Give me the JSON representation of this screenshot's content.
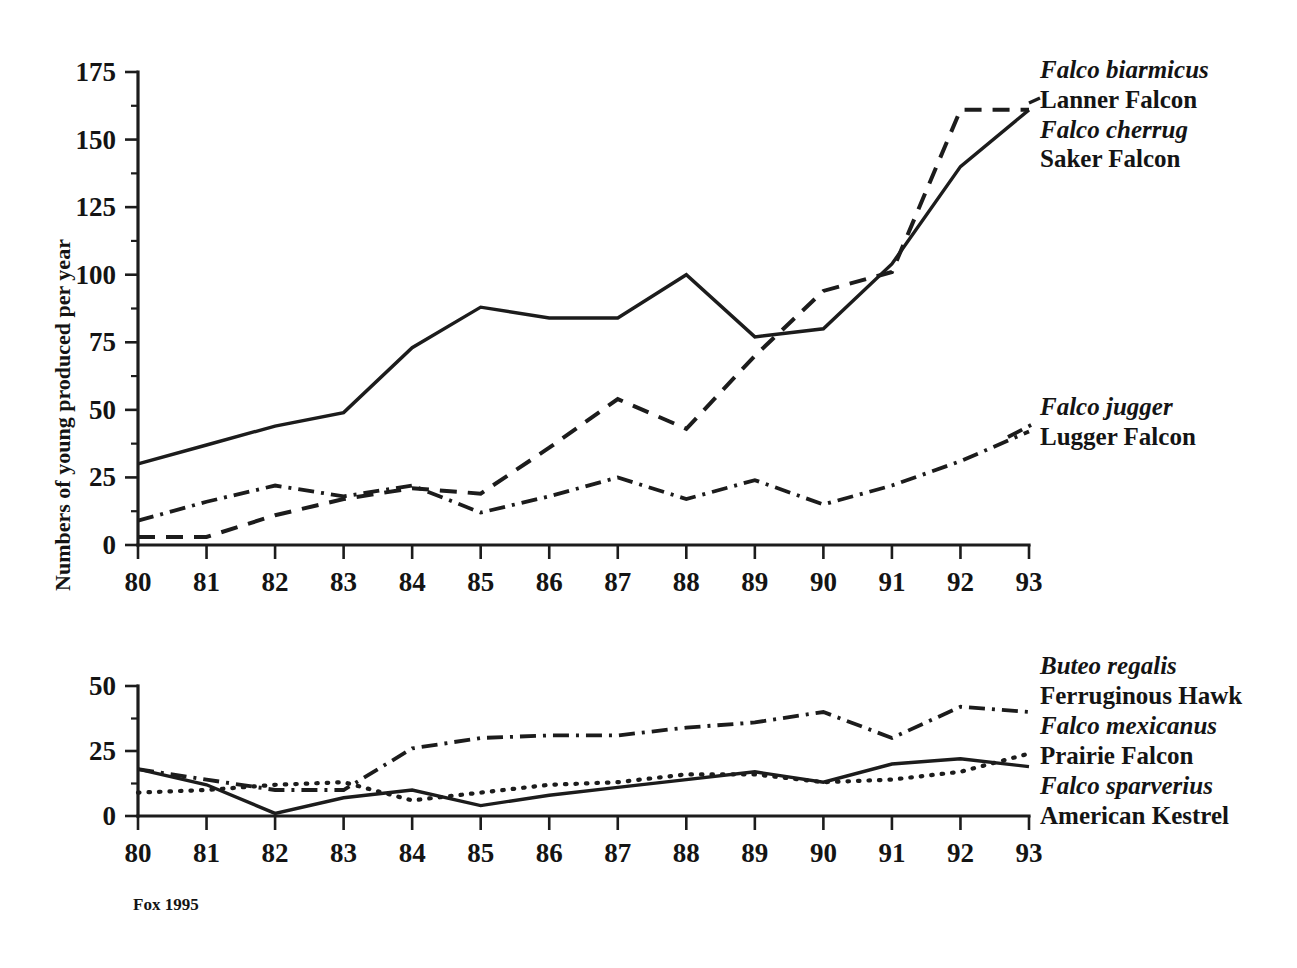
{
  "figure": {
    "source_note": "Fox 1995"
  },
  "chart_data": [
    {
      "id": "top",
      "type": "line",
      "title": "",
      "xlabel": "",
      "ylabel": "Numbers of young produced per year",
      "x": [
        80,
        81,
        82,
        83,
        84,
        85,
        86,
        87,
        88,
        89,
        90,
        91,
        92,
        93
      ],
      "xticklabels": [
        "80",
        "81",
        "82",
        "83",
        "84",
        "85",
        "86",
        "87",
        "88",
        "89",
        "90",
        "91",
        "92",
        "93"
      ],
      "yticks": [
        0,
        25,
        50,
        75,
        100,
        125,
        150,
        175
      ],
      "yticklabels": [
        "0",
        "25",
        "50",
        "75",
        "100",
        "125",
        "150",
        "175"
      ],
      "ylim": [
        0,
        175
      ],
      "grid": false,
      "legend_position": "right",
      "series": [
        {
          "name": "Saker Falcon",
          "scientific_name": "Falco cherrug",
          "style": "solid",
          "values": [
            30,
            37,
            44,
            49,
            73,
            88,
            84,
            84,
            100,
            77,
            80,
            104,
            140,
            161
          ]
        },
        {
          "name": "Lanner Falcon",
          "scientific_name": "Falco biarmicus",
          "style": "dashed",
          "values": [
            3,
            3,
            11,
            17,
            21,
            19,
            36,
            54,
            43,
            70,
            94,
            101,
            161,
            161
          ]
        },
        {
          "name": "Lugger Falcon",
          "scientific_name": "Falco jugger",
          "style": "dashdot",
          "values": [
            9,
            16,
            22,
            18,
            22,
            12,
            18,
            25,
            17,
            24,
            15,
            22,
            31,
            42
          ]
        }
      ]
    },
    {
      "id": "bottom",
      "type": "line",
      "title": "",
      "xlabel": "",
      "ylabel": "",
      "x": [
        80,
        81,
        82,
        83,
        84,
        85,
        86,
        87,
        88,
        89,
        90,
        91,
        92,
        93
      ],
      "xticklabels": [
        "80",
        "81",
        "82",
        "83",
        "84",
        "85",
        "86",
        "87",
        "88",
        "89",
        "90",
        "91",
        "92",
        "93"
      ],
      "yticks": [
        0,
        25,
        50
      ],
      "yticklabels": [
        "0",
        "25",
        "50"
      ],
      "ylim": [
        0,
        50
      ],
      "grid": false,
      "legend_position": "right",
      "series": [
        {
          "name": "Ferruginous Hawk",
          "scientific_name": "Buteo regalis",
          "style": "dashdot",
          "values": [
            18,
            14,
            10,
            10,
            26,
            30,
            31,
            31,
            34,
            36,
            40,
            30,
            42,
            40
          ]
        },
        {
          "name": "Prairie Falcon",
          "scientific_name": "Falco mexicanus",
          "style": "dotted",
          "values": [
            9,
            10,
            12,
            13,
            6,
            9,
            12,
            13,
            16,
            16,
            13,
            14,
            17,
            24
          ]
        },
        {
          "name": "American Kestrel",
          "scientific_name": "Falco sparverius",
          "style": "solid",
          "values": [
            18,
            12,
            1,
            7,
            10,
            4,
            8,
            11,
            14,
            17,
            13,
            20,
            22,
            19
          ]
        }
      ]
    }
  ],
  "legends": {
    "top": [
      {
        "scientific_name": "Falco biarmicus",
        "common_name": "Lanner Falcon"
      },
      {
        "scientific_name": "Falco cherrug",
        "common_name": "Saker Falcon"
      }
    ],
    "top_lugger": [
      {
        "scientific_name": "Falco jugger",
        "common_name": "Lugger Falcon"
      }
    ],
    "bottom": [
      {
        "scientific_name": "Buteo regalis",
        "common_name": "Ferruginous Hawk"
      },
      {
        "scientific_name": "Falco mexicanus",
        "common_name": "Prairie Falcon"
      },
      {
        "scientific_name": "Falco sparverius",
        "common_name": "American Kestrel"
      }
    ]
  }
}
